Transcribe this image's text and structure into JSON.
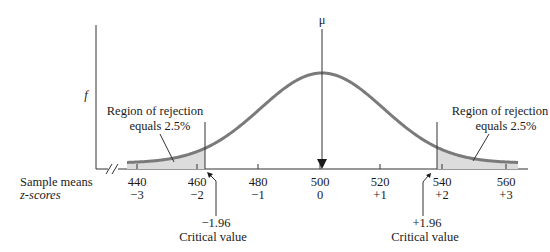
{
  "figure": {
    "y_axis_label": "f",
    "mu_label": "μ",
    "row_labels": {
      "sample_means": "Sample means",
      "z_scores": "z-scores"
    },
    "left_region": {
      "line1": "Region of rejection",
      "line2": "equals 2.5%"
    },
    "right_region": {
      "line1": "Region of rejection",
      "line2": "equals 2.5%"
    },
    "left_critical": {
      "value": "−1.96",
      "label": "Critical value"
    },
    "right_critical": {
      "value": "+1.96",
      "label": "Critical value"
    },
    "ticks": [
      {
        "mean": "440",
        "z": "−3"
      },
      {
        "mean": "460",
        "z": "−2"
      },
      {
        "mean": "480",
        "z": "−1"
      },
      {
        "mean": "500",
        "z": "0"
      },
      {
        "mean": "520",
        "z": "+1"
      },
      {
        "mean": "540",
        "z": "+2"
      },
      {
        "mean": "560",
        "z": "+3"
      }
    ],
    "colors": {
      "curve": "#7a7a7a",
      "shade": "#dcdcdc",
      "axis": "#333333"
    }
  },
  "chart_data": {
    "type": "area",
    "title": "",
    "xlabel": "Sample means / z-scores",
    "ylabel": "f",
    "distribution": "normal",
    "mean": 500,
    "sd": 20,
    "x": [
      440,
      460,
      480,
      500,
      520,
      540,
      560
    ],
    "z": [
      -3,
      -2,
      -1,
      0,
      1,
      2,
      3
    ],
    "critical_values_z": [
      -1.96,
      1.96
    ],
    "rejection_regions": [
      {
        "side": "left",
        "tail_probability": 0.025,
        "label": "Region of rejection equals 2.5%"
      },
      {
        "side": "right",
        "tail_probability": 0.025,
        "label": "Region of rejection equals 2.5%"
      }
    ],
    "annotations": [
      "μ",
      "−1.96 Critical value",
      "+1.96 Critical value"
    ]
  }
}
